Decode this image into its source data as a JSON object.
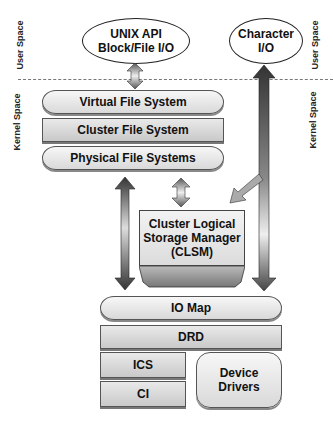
{
  "diagram": {
    "side_labels": {
      "left_user": "User  Space",
      "left_kernel": "Kernel  Space",
      "right_user": "User  Space",
      "right_kernel": "Kernel  Space"
    },
    "user_space": {
      "unix_api": {
        "line1": "UNIX API",
        "line2": "Block/File I/O"
      },
      "character_io": {
        "line1": "Character",
        "line2": "I/O"
      }
    },
    "filesystem_stack": [
      "Virtual File System",
      "Cluster File System",
      "Physical File Systems"
    ],
    "clsm": {
      "line1": "Cluster Logical",
      "line2": "Storage Manager",
      "line3": "(CLSM)"
    },
    "io_stack": {
      "io_map": "IO Map",
      "drd": "DRD",
      "ics": "ICS",
      "ci": "CI",
      "device_drivers": {
        "line1": "Device",
        "line2": "Drivers"
      }
    },
    "colors": {
      "arrow_dark": "#333333",
      "arrow_light": "#dddddd",
      "layer_fill": "#d9d9d9"
    }
  }
}
